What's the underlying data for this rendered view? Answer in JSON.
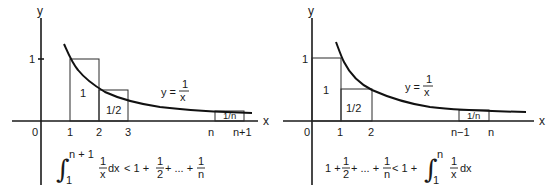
{
  "left_panel": {
    "axis_labels": {
      "x": "x",
      "y": "y"
    },
    "y_tick": "1",
    "x_ticks": [
      "0",
      "1",
      "2",
      "3",
      "n",
      "n+1"
    ],
    "curve_label": {
      "lhs": "y =",
      "num": "1",
      "den": "x"
    },
    "rect_labels": [
      "1",
      "1/2",
      "1/n"
    ],
    "inequality": {
      "int_upper": "n + 1",
      "int_lower": "1",
      "integrand_num": "1",
      "integrand_den": "x",
      "dx": "dx",
      "lt": "< 1 +",
      "term2_num": "1",
      "term2_den": "2",
      "dots": "+ ... +",
      "termn_num": "1",
      "termn_den": "n"
    }
  },
  "right_panel": {
    "axis_labels": {
      "x": "x",
      "y": "y"
    },
    "y_tick": "1",
    "x_ticks": [
      "0",
      "1",
      "2",
      "n−1",
      "n"
    ],
    "curve_label": {
      "lhs": "y =",
      "num": "1",
      "den": "x"
    },
    "rect_labels": [
      "1",
      "1/2",
      "1/n"
    ],
    "inequality": {
      "lead": "1 +",
      "term2_num": "1",
      "term2_den": "2",
      "dots": "+ ... +",
      "termn_num": "1",
      "termn_den": "n",
      "lt": "< 1 +",
      "int_upper": "n",
      "int_lower": "1",
      "integrand_num": "1",
      "integrand_den": "x",
      "dx": "dx"
    }
  }
}
